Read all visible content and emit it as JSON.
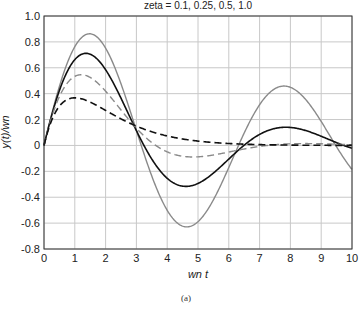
{
  "chart_data": {
    "type": "line",
    "title": "zeta = 0.1, 0.25, 0.5, 1.0",
    "xlabel": "wn t",
    "ylabel": "y(t)/wn",
    "caption": "(a)",
    "xlim": [
      0,
      10
    ],
    "ylim": [
      -0.8,
      1.0
    ],
    "xticks": [
      "0",
      "1",
      "2",
      "3",
      "4",
      "5",
      "6",
      "7",
      "8",
      "9",
      "10"
    ],
    "yticks": [
      "1.0",
      "0.8",
      "0.6",
      "0.4",
      "0.2",
      "0",
      "-0.2",
      "-0.4",
      "-0.6",
      "-0.8"
    ],
    "grid": true,
    "legend": "none",
    "series": [
      {
        "name": "zeta = 0.1",
        "style": "solid",
        "color": "#8a8a8a",
        "width": 1.4,
        "x": [
          0,
          0.5,
          1,
          1.5,
          2,
          2.5,
          3,
          3.5,
          4,
          4.5,
          5,
          5.5,
          6,
          6.5,
          7,
          7.5,
          8,
          8.5,
          9,
          9.5,
          10
        ],
        "values": [
          0,
          0.456,
          0.762,
          0.852,
          0.743,
          0.49,
          0.164,
          -0.161,
          -0.411,
          -0.561,
          -0.585,
          -0.494,
          -0.318,
          -0.11,
          0.148,
          0.331,
          0.44,
          0.432,
          0.321,
          0.138,
          -0.152
        ]
      },
      {
        "name": "zeta = 0.25",
        "style": "solid",
        "color": "#111111",
        "width": 1.6,
        "x": [
          0,
          0.5,
          1,
          1.5,
          2,
          2.5,
          3,
          3.5,
          4,
          4.5,
          5,
          5.5,
          6,
          6.5,
          7,
          7.5,
          8,
          8.5,
          9,
          9.5,
          10
        ],
        "values": [
          0,
          0.416,
          0.639,
          0.7,
          0.612,
          0.419,
          0.169,
          -0.06,
          -0.221,
          -0.303,
          -0.309,
          -0.256,
          -0.165,
          -0.06,
          0.033,
          0.1,
          0.131,
          0.128,
          0.098,
          0.05,
          -0.045
        ]
      },
      {
        "name": "zeta = 0.5",
        "style": "dashed",
        "color": "#8a8a8a",
        "width": 1.4,
        "x": [
          0,
          0.5,
          1,
          1.5,
          2,
          2.5,
          3,
          3.5,
          4,
          4.5,
          5,
          5.5,
          6,
          6.5,
          7,
          7.5,
          8,
          8.5,
          9,
          9.5,
          10
        ],
        "values": [
          0,
          0.338,
          0.503,
          0.54,
          0.484,
          0.37,
          0.232,
          0.105,
          0.007,
          -0.058,
          -0.086,
          -0.084,
          -0.068,
          -0.045,
          -0.022,
          -0.004,
          0.006,
          0.011,
          0.012,
          0.01,
          0.001
        ]
      },
      {
        "name": "zeta = 1.0",
        "style": "dashed",
        "color": "#111111",
        "width": 1.6,
        "x": [
          0,
          0.5,
          1,
          1.5,
          2,
          2.5,
          3,
          3.5,
          4,
          4.5,
          5,
          5.5,
          6,
          6.5,
          7,
          7.5,
          8,
          8.5,
          9,
          9.5,
          10
        ],
        "values": [
          0,
          0.303,
          0.368,
          0.335,
          0.271,
          0.205,
          0.149,
          0.106,
          0.073,
          0.05,
          0.034,
          0.022,
          0.015,
          0.01,
          0.006,
          0.004,
          0.003,
          0.002,
          0.001,
          0.001,
          0.0
        ]
      }
    ]
  }
}
